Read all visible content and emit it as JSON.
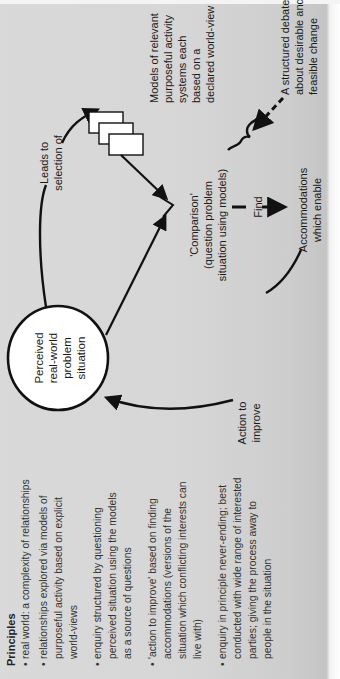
{
  "diagram": {
    "colors": {
      "background": "#d7d7d7",
      "ink": "#111111",
      "box_fill": "#ffffff"
    },
    "nodes": {
      "problem_situation": {
        "lines": [
          "Perceived",
          "real-world",
          "problem",
          "situation"
        ]
      },
      "models": {
        "lines": [
          "Models of relevant",
          "purposeful activity",
          "systems each",
          "based on a",
          "declared world-view"
        ]
      },
      "comparison": {
        "lines": [
          "'Comparison'",
          "(question problem",
          "situation using models)"
        ]
      },
      "accommodations": {
        "lines": [
          "Accommodations",
          "which enable"
        ]
      },
      "debate": {
        "lines": [
          "A structured debate",
          "about desirable and",
          "feasible change"
        ]
      }
    },
    "edges": {
      "leads_to": {
        "lines": [
          "Leads to",
          "selection of"
        ]
      },
      "find": {
        "label": "Find"
      },
      "action": {
        "lines": [
          "Action to",
          "improve"
        ]
      }
    },
    "principles": {
      "heading": "Principles",
      "items": [
        {
          "lines": [
            "real world: a complexity of relationships"
          ]
        },
        {
          "lines": [
            "relationships explored via models of",
            "purposeful activity based on explicit",
            "world-views"
          ]
        },
        {
          "lines": [
            "enquiry structured by questioning",
            "perceived situation using the models",
            "as a source of questions"
          ]
        },
        {
          "lines": [
            "'action to improve' based on finding",
            "accommodations (versions of the",
            "situation which conflicting interests can",
            "live with)"
          ]
        },
        {
          "lines": [
            "enquiry in principle never-ending; best",
            "conducted with wide range of interested",
            "parties; giving the process away to",
            "people in the situation"
          ]
        }
      ],
      "bullet": "•"
    }
  }
}
